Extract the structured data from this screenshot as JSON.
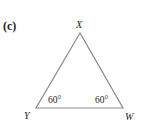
{
  "figure": {
    "part_label": "(c)",
    "triangle": {
      "vertices": [
        {
          "name": "X",
          "x": 80,
          "y": 33
        },
        {
          "name": "Y",
          "x": 36,
          "y": 108
        },
        {
          "name": "W",
          "x": 123,
          "y": 108
        }
      ],
      "angles": [
        {
          "at": "Y",
          "label": "60°"
        },
        {
          "at": "W",
          "label": "60°"
        }
      ],
      "stroke_color": "#8a8a8a"
    }
  }
}
